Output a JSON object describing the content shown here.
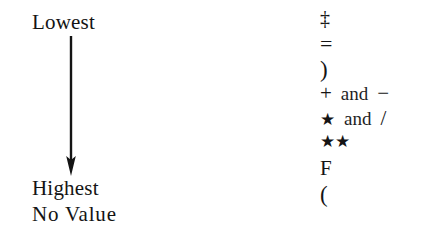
{
  "figure": {
    "scale": {
      "top_label": "Lowest",
      "bottom_label": "Highest",
      "no_value_label": "No Value",
      "arrow_direction": "down"
    },
    "symbol_rows": [
      {
        "glyph": "‡",
        "conjunction": "",
        "glyph2": "",
        "rank": "lowest"
      },
      {
        "glyph": "=",
        "conjunction": "",
        "glyph2": "",
        "rank": "2"
      },
      {
        "glyph": ")",
        "conjunction": "",
        "glyph2": "",
        "rank": "3"
      },
      {
        "glyph": "+",
        "conjunction": "and",
        "glyph2": "−",
        "rank": "4"
      },
      {
        "glyph": "★",
        "conjunction": "and",
        "glyph2": "/",
        "rank": "5"
      },
      {
        "glyph": "★★",
        "conjunction": "",
        "glyph2": "",
        "rank": "6"
      },
      {
        "glyph": "F",
        "conjunction": "",
        "glyph2": "",
        "rank": "highest"
      },
      {
        "glyph": "(",
        "conjunction": "",
        "glyph2": "",
        "rank": "no-value"
      }
    ],
    "colors": {
      "background": "#ffffff",
      "ink": "#141414"
    }
  }
}
